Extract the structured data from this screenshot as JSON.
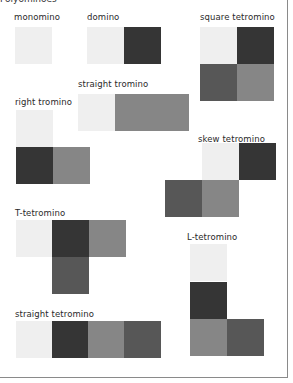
{
  "header": {
    "cut_text": "Polyominoes"
  },
  "colors": {
    "light": "#efefef",
    "darkest": "#353535",
    "mid": "#868686",
    "dark": "#575757",
    "border": "#8a8a8a"
  },
  "pieces": [
    {
      "name": "monomino",
      "label": "monomino",
      "label_pos": [
        14,
        12
      ],
      "squares": [
        {
          "x": 15,
          "y": 27,
          "shade": "light"
        }
      ]
    },
    {
      "name": "domino",
      "label": "domino",
      "label_pos": [
        87,
        12
      ],
      "squares": [
        {
          "x": 87,
          "y": 27,
          "shade": "light"
        },
        {
          "x": 124,
          "y": 27,
          "shade": "darkest"
        }
      ]
    },
    {
      "name": "square-tetromino",
      "label": "square tetromino",
      "label_pos": [
        200,
        12
      ],
      "squares": [
        {
          "x": 200,
          "y": 27,
          "shade": "light"
        },
        {
          "x": 237,
          "y": 27,
          "shade": "darkest"
        },
        {
          "x": 200,
          "y": 64,
          "shade": "dark"
        },
        {
          "x": 237,
          "y": 64,
          "shade": "mid"
        }
      ]
    },
    {
      "name": "straight-tromino",
      "label": "straight tromino",
      "label_pos": [
        78,
        79
      ],
      "squares": [
        {
          "x": 78,
          "y": 94,
          "shade": "light"
        },
        {
          "x": 115,
          "y": 94,
          "shade": "mid"
        },
        {
          "x": 152,
          "y": 94,
          "shade": "mid"
        }
      ]
    },
    {
      "name": "right-tromino",
      "label": "right tromino",
      "label_pos": [
        15,
        97
      ],
      "squares": [
        {
          "x": 16,
          "y": 110,
          "shade": "light"
        },
        {
          "x": 16,
          "y": 147,
          "shade": "darkest"
        },
        {
          "x": 53,
          "y": 147,
          "shade": "mid"
        }
      ]
    },
    {
      "name": "skew-tetromino",
      "label": "skew tetromino",
      "label_pos": [
        198,
        134
      ],
      "squares": [
        {
          "x": 202,
          "y": 143,
          "shade": "light"
        },
        {
          "x": 239,
          "y": 143,
          "shade": "darkest"
        },
        {
          "x": 165,
          "y": 180,
          "shade": "dark"
        },
        {
          "x": 202,
          "y": 180,
          "shade": "mid"
        }
      ]
    },
    {
      "name": "t-tetromino",
      "label": "T-tetromino",
      "label_pos": [
        15,
        208
      ],
      "squares": [
        {
          "x": 16,
          "y": 220,
          "shade": "light"
        },
        {
          "x": 52,
          "y": 220,
          "shade": "darkest"
        },
        {
          "x": 89,
          "y": 220,
          "shade": "mid"
        },
        {
          "x": 52,
          "y": 257,
          "shade": "dark"
        }
      ]
    },
    {
      "name": "l-tetromino",
      "label": "L-tetromino",
      "label_pos": [
        187,
        232
      ],
      "squares": [
        {
          "x": 190,
          "y": 244,
          "shade": "light"
        },
        {
          "x": 190,
          "y": 282,
          "shade": "darkest"
        },
        {
          "x": 190,
          "y": 319,
          "shade": "mid"
        },
        {
          "x": 227,
          "y": 319,
          "shade": "dark"
        }
      ]
    },
    {
      "name": "straight-tetromino",
      "label": "straight tetromino",
      "label_pos": [
        15,
        309
      ],
      "squares": [
        {
          "x": 16,
          "y": 321,
          "shade": "light"
        },
        {
          "x": 52,
          "y": 321,
          "shade": "darkest"
        },
        {
          "x": 88,
          "y": 321,
          "shade": "mid"
        },
        {
          "x": 124,
          "y": 321,
          "shade": "dark"
        }
      ]
    }
  ]
}
